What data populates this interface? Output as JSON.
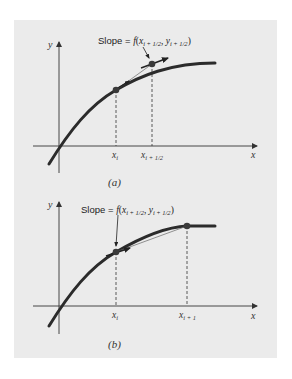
{
  "colors": {
    "page_bg": "#ffffff",
    "panel_bg": "#ebebeb",
    "curve": "#2b2b2b",
    "axis": "#333333",
    "point": "#3a3a3a",
    "secant": "#666666"
  },
  "panels": [
    {
      "id": "a",
      "caption": "(a)",
      "axis_y_label": "y",
      "axis_x_label": "x",
      "annotation": {
        "prefix": "Slope = ",
        "func": "f",
        "open": "(",
        "x": "x",
        "x_sub": "i + 1/2",
        "sep": ", ",
        "y": "y",
        "y_sub": "i + 1/2",
        "close": ")"
      },
      "tick_labels": [
        {
          "base": "x",
          "sub": "i"
        },
        {
          "base": "x",
          "sub": "i + 1/2"
        }
      ]
    },
    {
      "id": "b",
      "caption": "(b)",
      "axis_y_label": "y",
      "axis_x_label": "x",
      "annotation": {
        "prefix": "Slope = ",
        "func": "f",
        "open": "(",
        "x": "x",
        "x_sub": "i + 1/2",
        "sep": ", ",
        "y": "y",
        "y_sub": "i + 1/2",
        "close": ")"
      },
      "tick_labels": [
        {
          "base": "x",
          "sub": "i"
        },
        {
          "base": "x",
          "sub": "i + 1"
        }
      ]
    }
  ]
}
